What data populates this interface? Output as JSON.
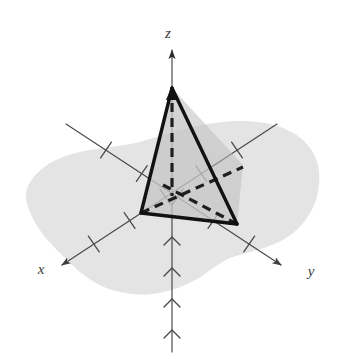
{
  "figure": {
    "background_color": "#ffffff",
    "width": 341,
    "height": 359
  },
  "plane": {
    "name": "xy-plane region",
    "fill_color": "#e4e4e4",
    "description": "irregular shaded blob representing the xy-plane"
  },
  "axes": {
    "stroke_color": "#4a4a4a",
    "x": {
      "label": "x",
      "label_x": 41,
      "label_y": 270,
      "direction": "lower-left",
      "tick_count": 5,
      "tick_style": "perpendicular-dash"
    },
    "y": {
      "label": "y",
      "label_x": 311,
      "label_y": 272,
      "direction": "lower-right",
      "tick_count": 5,
      "tick_style": "perpendicular-dash"
    },
    "z": {
      "label": "z",
      "label_x": 166,
      "label_y": 34,
      "direction": "vertical-up",
      "tick_count": 6,
      "tick_style": "chevron"
    }
  },
  "origin": {
    "label": "origin",
    "x": 172,
    "y": 190
  },
  "tetrahedron": {
    "name": "tetrahedron",
    "edge_color": "#1a1a1a",
    "edge_width": 3,
    "hidden_edge_style": "dashed",
    "face_fill_left": "#c9c9c9",
    "face_fill_right": "#bdbdbd",
    "vertices": {
      "apex": {
        "label": "apex on z-axis",
        "x": 172,
        "y": 88
      },
      "base_front_left": {
        "label": "base vertex on x-axis",
        "x": 141,
        "y": 213
      },
      "base_front_right": {
        "label": "base vertex on y-axis",
        "x": 237,
        "y": 224
      },
      "base_back": {
        "label": "hidden base vertex",
        "x": 243,
        "y": 165
      }
    }
  }
}
